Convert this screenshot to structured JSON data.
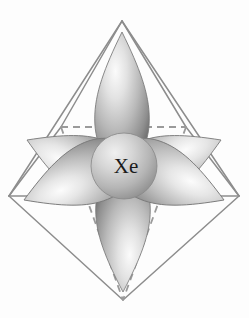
{
  "figure": {
    "caption": "",
    "background_color": "#fdfdfd",
    "line_color": "#8d8d8d",
    "lobe_light": "#f4f4f4",
    "lobe_mid": "#b6b6b6",
    "lobe_dark": "#6f6f6f",
    "atom_light": "#ebebeb",
    "atom_mid": "#bdbdbd",
    "atom_dark": "#8a8a8a",
    "label_color": "#1b1b1b"
  },
  "atom": {
    "symbol": "Xe",
    "center_x": 124,
    "center_y": 166,
    "radius": 33
  },
  "geometry": {
    "shape": "octahedron",
    "vertices": [
      {
        "name": "top-apex",
        "x": 122,
        "y": 21
      },
      {
        "name": "bottom-apex",
        "x": 123,
        "y": 300
      },
      {
        "name": "front-left",
        "x": 9,
        "y": 196
      },
      {
        "name": "front-right",
        "x": 239,
        "y": 196
      },
      {
        "name": "back-left",
        "x": 61,
        "y": 127
      },
      {
        "name": "back-right",
        "x": 186,
        "y": 127
      }
    ],
    "solid_edges": [
      [
        "top-apex",
        "front-left"
      ],
      [
        "top-apex",
        "front-right"
      ],
      [
        "top-apex",
        "back-left"
      ],
      [
        "top-apex",
        "back-right"
      ],
      [
        "bottom-apex",
        "front-left"
      ],
      [
        "bottom-apex",
        "front-right"
      ],
      [
        "front-left",
        "back-left"
      ],
      [
        "front-right",
        "back-right"
      ],
      [
        "front-left",
        "front-right"
      ]
    ],
    "dashed_edges": [
      [
        "back-left",
        "back-right"
      ],
      [
        "back-left",
        "bottom-apex"
      ],
      [
        "back-right",
        "bottom-apex"
      ]
    ]
  },
  "orbitals": {
    "count": 6,
    "type": "sp3d2 hybrid lobe",
    "lobes": [
      {
        "name": "lobe-up",
        "direction": "up",
        "tip_x": 122,
        "tip_y": 32,
        "angle_deg": 0,
        "length": 118,
        "width": 52
      },
      {
        "name": "lobe-down",
        "direction": "down",
        "tip_x": 123,
        "tip_y": 291,
        "angle_deg": 180,
        "length": 112,
        "width": 52
      },
      {
        "name": "lobe-back-left",
        "direction": "back-left",
        "tip_x": 24,
        "tip_y": 141,
        "angle_deg": 290,
        "length": 108,
        "width": 62
      },
      {
        "name": "lobe-back-right",
        "direction": "back-right",
        "tip_x": 224,
        "tip_y": 141,
        "angle_deg": 70,
        "length": 108,
        "width": 62
      },
      {
        "name": "lobe-front-left",
        "direction": "front-left",
        "tip_x": 22,
        "tip_y": 196,
        "angle_deg": 250,
        "length": 110,
        "width": 62
      },
      {
        "name": "lobe-front-right",
        "direction": "front-right",
        "tip_x": 226,
        "tip_y": 196,
        "angle_deg": 110,
        "length": 110,
        "width": 62
      }
    ]
  },
  "ghost_text": {
    "line1": "",
    "line2": "",
    "line3": ""
  }
}
